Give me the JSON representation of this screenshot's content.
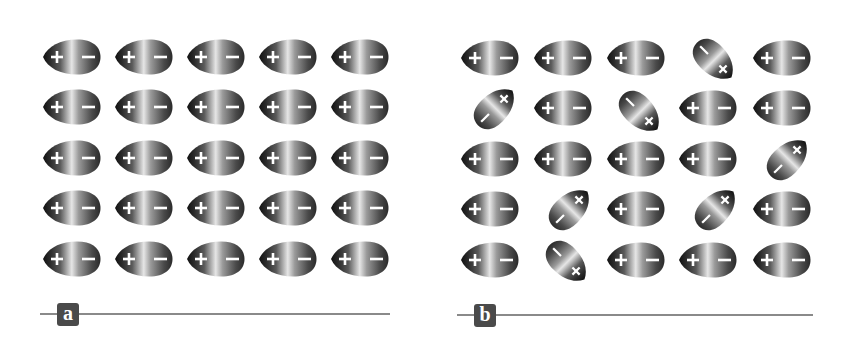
{
  "figure": {
    "symbols": {
      "positive": "+",
      "negative": "−"
    },
    "colors": {
      "dark": "#111111",
      "mid": "#5a5a5a",
      "light": "#e6e6e6",
      "line": "#8a8a8a",
      "label_bg": "#4a4a4a",
      "label_text": "#ffffff"
    }
  },
  "panels": [
    {
      "label": "a",
      "origin_x": 0,
      "line": {
        "x1": 40,
        "x2": 390,
        "y": 314
      },
      "label_box": {
        "x": 57,
        "y": 303
      },
      "grid": {
        "rows": 5,
        "cols": 5,
        "col_x": [
          43,
          115,
          187,
          259,
          331
        ],
        "row_y": [
          39,
          89,
          140,
          190,
          241
        ]
      },
      "tilted": []
    },
    {
      "label": "b",
      "origin_x": 0,
      "line": {
        "x1": 457,
        "x2": 813,
        "y": 315
      },
      "label_box": {
        "x": 474,
        "y": 304
      },
      "grid": {
        "rows": 5,
        "cols": 5,
        "col_x": [
          461,
          534,
          607,
          679,
          753
        ],
        "row_y": [
          40,
          90,
          141,
          191,
          242
        ]
      },
      "tilted": [
        {
          "row": 0,
          "col": 3,
          "cx": 714,
          "cy": 60,
          "angle": -135
        },
        {
          "row": 1,
          "col": 0,
          "cx": 495,
          "cy": 108,
          "angle": 135
        },
        {
          "row": 1,
          "col": 2,
          "cx": 640,
          "cy": 112,
          "angle": -135
        },
        {
          "row": 2,
          "col": 4,
          "cx": 788,
          "cy": 159,
          "angle": 135
        },
        {
          "row": 3,
          "col": 1,
          "cx": 570,
          "cy": 209,
          "angle": 135
        },
        {
          "row": 3,
          "col": 3,
          "cx": 716,
          "cy": 209,
          "angle": 135
        },
        {
          "row": 4,
          "col": 1,
          "cx": 567,
          "cy": 262,
          "angle": -135
        }
      ]
    }
  ]
}
